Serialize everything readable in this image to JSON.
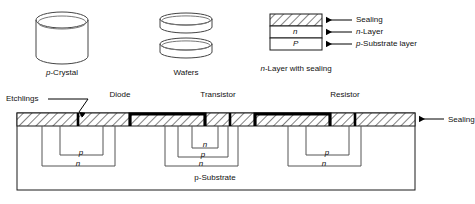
{
  "diagram": {
    "title_hidden": "",
    "stages": {
      "crystal": {
        "label": "p-Crystal",
        "label_italic_prefix": "p",
        "label_rest": "-Crystal"
      },
      "wafers": {
        "label": "Wafers",
        "count": 2
      },
      "layer_stack": {
        "caption": "n-Layer with sealing",
        "caption_italic_prefix": "n",
        "caption_rest": "-Layer with sealing",
        "layers": [
          {
            "fill": "hatch",
            "text": "",
            "callout": "Sealing"
          },
          {
            "fill": "white",
            "text": "n",
            "callout": "n-Layer"
          },
          {
            "fill": "white",
            "text": "P",
            "callout": "p-Substrate layer"
          }
        ]
      }
    },
    "cross_section": {
      "device_labels": [
        "Diode",
        "Transistor",
        "Resistor"
      ],
      "etchlings_label": "Etchlings",
      "sealing_label": "Sealing",
      "substrate_label": "p-Substrate",
      "wells": {
        "diode": [
          "p",
          "n"
        ],
        "transistor": [
          "n",
          "p",
          "n"
        ],
        "resistor": [
          "p",
          "n"
        ]
      }
    },
    "colors": {
      "line": "#1a1a1a",
      "hatch": "#1a1a1a",
      "electrode": "#000000",
      "background": "#ffffff",
      "well_line": "#555555"
    }
  }
}
